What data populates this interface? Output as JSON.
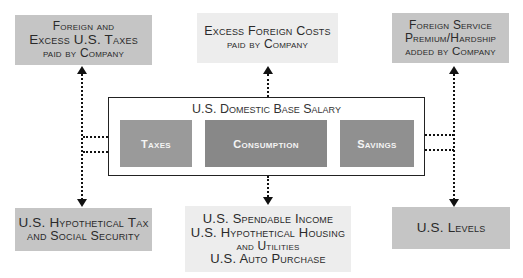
{
  "diagram": {
    "top_boxes": [
      {
        "id": "foreign-excess-taxes",
        "lines": [
          "Foreign and",
          "Excess U.S. Taxes",
          "paid by Company"
        ]
      },
      {
        "id": "excess-foreign-costs",
        "lines": [
          "Excess Foreign Costs",
          "paid by Company"
        ]
      },
      {
        "id": "foreign-service-premium",
        "lines": [
          "Foreign Service",
          "Premium/Hardship",
          "added by Company"
        ]
      }
    ],
    "center": {
      "title": "U.S. Domestic Base Salary",
      "components": [
        {
          "id": "taxes",
          "label": "Taxes"
        },
        {
          "id": "consumption",
          "label": "Consumption"
        },
        {
          "id": "savings",
          "label": "Savings"
        }
      ]
    },
    "bottom_boxes": [
      {
        "id": "hypothetical-tax",
        "lines": [
          "U.S. Hypothetical Tax",
          "and Social Security"
        ]
      },
      {
        "id": "spendable-income",
        "lines": [
          "U.S. Spendable Income",
          "U.S. Hypothetical Housing",
          "and Utilities",
          "U.S. Auto Purchase"
        ]
      },
      {
        "id": "us-levels",
        "lines": [
          "U.S. Levels"
        ]
      }
    ],
    "colors": {
      "dark_box": "#c5c5c5",
      "light_box": "#ededed",
      "taxes_fill": "#9a9a9a",
      "consumption_fill": "#888888",
      "savings_fill": "#909090",
      "connector": "#111111"
    }
  }
}
